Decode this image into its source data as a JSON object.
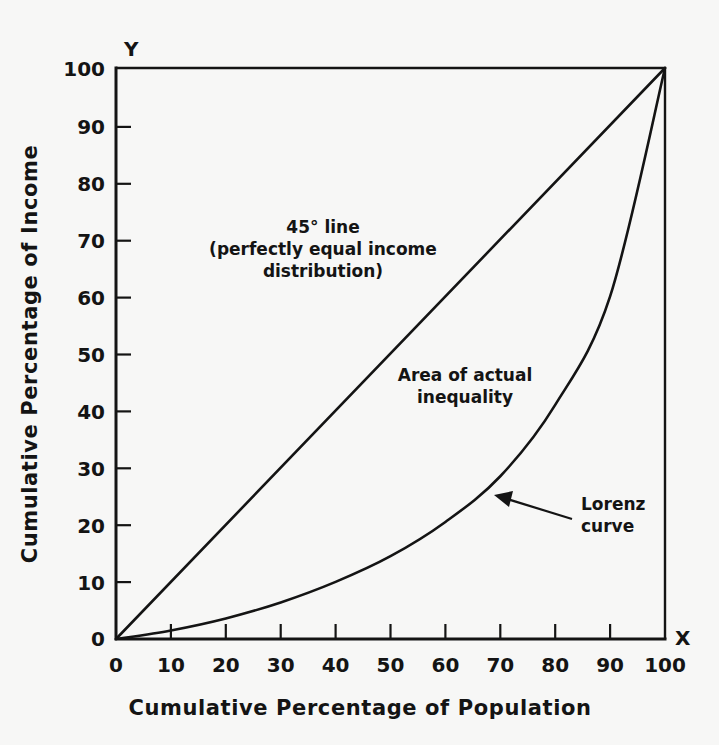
{
  "figure": {
    "background_color": "#f7f7f6",
    "ink_color": "#141414"
  },
  "chart_data": {
    "type": "line",
    "title": "",
    "subtitle": "",
    "xlabel": "Cumulative  Percentage of Population",
    "ylabel": "Cumulative Percentage of Income",
    "xlim": [
      0,
      100
    ],
    "ylim": [
      0,
      100
    ],
    "grid": false,
    "legend_position": "inline-annotations",
    "x_axis_letter": "X",
    "y_axis_letter": "Y",
    "x_ticks": [
      "0",
      "10",
      "20",
      "30",
      "40",
      "50",
      "60",
      "70",
      "80",
      "90",
      "100"
    ],
    "y_ticks": [
      "0",
      "10",
      "20",
      "30",
      "40",
      "50",
      "60",
      "70",
      "80",
      "90",
      "100"
    ],
    "x_tick_values": [
      0,
      10,
      20,
      30,
      40,
      50,
      60,
      70,
      80,
      90,
      100
    ],
    "y_tick_values": [
      0,
      10,
      20,
      30,
      40,
      50,
      60,
      70,
      80,
      90,
      100
    ],
    "series": [
      {
        "name": "45° line (perfectly equal income distribution)",
        "x": [
          0,
          10,
          20,
          30,
          40,
          50,
          60,
          70,
          80,
          90,
          100
        ],
        "values": [
          0,
          10,
          20,
          30,
          40,
          50,
          60,
          70,
          80,
          90,
          100
        ]
      },
      {
        "name": "Lorenz curve",
        "x": [
          0,
          10,
          20,
          30,
          40,
          50,
          60,
          70,
          80,
          90,
          100
        ],
        "values": [
          0,
          1.5,
          3.6,
          6.4,
          10.0,
          14.5,
          20.5,
          28.5,
          41.0,
          60.0,
          100.0
        ]
      }
    ],
    "annotations": [
      {
        "id": "equality-line-label",
        "lines": [
          "45° line",
          "(perfectly equal income",
          "distribution)"
        ],
        "x": 43,
        "y": 70
      },
      {
        "id": "inequality-area-label",
        "lines": [
          "Area of actual",
          "inequality"
        ],
        "x": 63,
        "y": 45
      },
      {
        "id": "lorenz-curve-label",
        "lines": [
          "Lorenz",
          "curve"
        ],
        "x": 84,
        "y": 24,
        "arrow_to_x": 70,
        "arrow_to_y": 24
      }
    ]
  }
}
